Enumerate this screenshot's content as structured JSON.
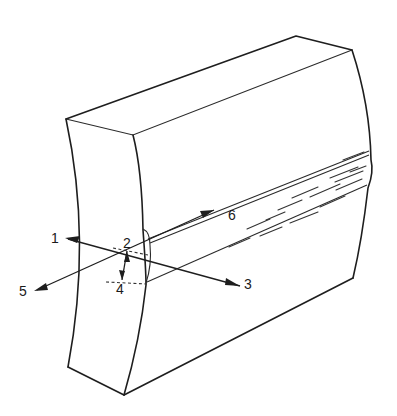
{
  "figure": {
    "labels": [
      {
        "id": "1",
        "text": "1"
      },
      {
        "id": "2",
        "text": "2"
      },
      {
        "id": "3",
        "text": "3"
      },
      {
        "id": "4",
        "text": "4"
      },
      {
        "id": "5",
        "text": "5"
      },
      {
        "id": "6",
        "text": "6"
      }
    ],
    "colors": {
      "line": "#1e1e1e",
      "background": "#ffffff"
    }
  }
}
